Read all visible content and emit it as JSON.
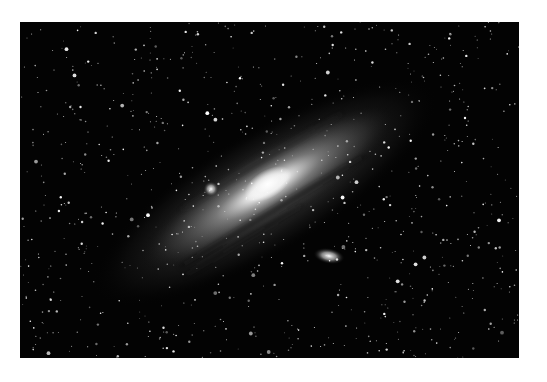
{
  "image": {
    "subject": "Spiral galaxy with companion galaxies in a dense star field",
    "background_color": "#ffffff",
    "sky_color": "#030303",
    "galaxy_core_color": "#ffffff",
    "galaxy_halo_color": "#9a9a9a"
  }
}
